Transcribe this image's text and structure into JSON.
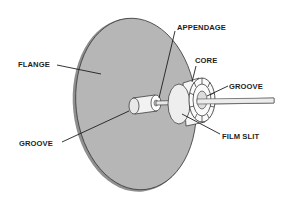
{
  "diagram": {
    "labels": {
      "flange": "FLANGE",
      "appendage": "APPENDAGE",
      "core": "CORE",
      "groove_core": "GROOVE",
      "groove_hub": "GROOVE",
      "film_slit": "FILM SLIT"
    },
    "colors": {
      "flange_fill": "#b4b4b4",
      "outline": "#2a2a2a",
      "part_fill": "#f4f4f4",
      "background": "#ffffff"
    }
  }
}
